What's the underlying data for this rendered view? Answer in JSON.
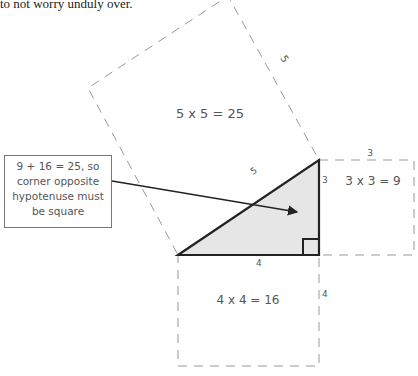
{
  "caption": "to not worry unduly over.",
  "diagram": {
    "hypotenuse_square": {
      "label": "5 x 5 = 25",
      "side_label": "5"
    },
    "side3_square": {
      "label": "3 x 3 = 9",
      "side_label": "3"
    },
    "side4_square": {
      "label": "4 x 4 = 16",
      "side_label": "4"
    },
    "triangle": {
      "hyp_label": "5",
      "vertical_label": "3",
      "base_label": "4"
    },
    "note": {
      "lines": [
        "9 + 16 = 25, so",
        "corner opposite",
        "hypotenuse must",
        "be square"
      ]
    }
  },
  "colors": {
    "triangle_fill": "#e6e6e6",
    "stroke": "#222222",
    "dash": "#999999"
  }
}
